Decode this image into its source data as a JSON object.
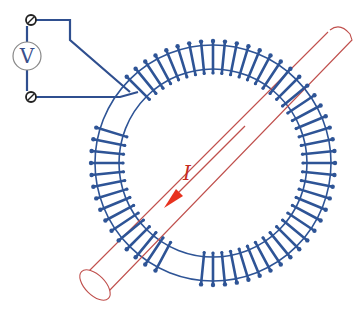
{
  "diagram": {
    "voltmeter": {
      "label": "V",
      "center": [
        27,
        56
      ],
      "radius": 14
    },
    "current": {
      "label": "I",
      "direction": "down-left"
    },
    "toroid": {
      "center": [
        213,
        163
      ],
      "outer_radius": 122,
      "inner_radius": 90,
      "turns": 64
    },
    "conductor": {
      "start": [
        340,
        40
      ],
      "end": [
        95,
        285
      ],
      "radius": 13
    },
    "colors": {
      "wire": "#2f4f8f",
      "coil": "#2e5496",
      "pipe": "#c0504d",
      "arrow": "#e8321e",
      "meter_outline": "#888888"
    }
  }
}
